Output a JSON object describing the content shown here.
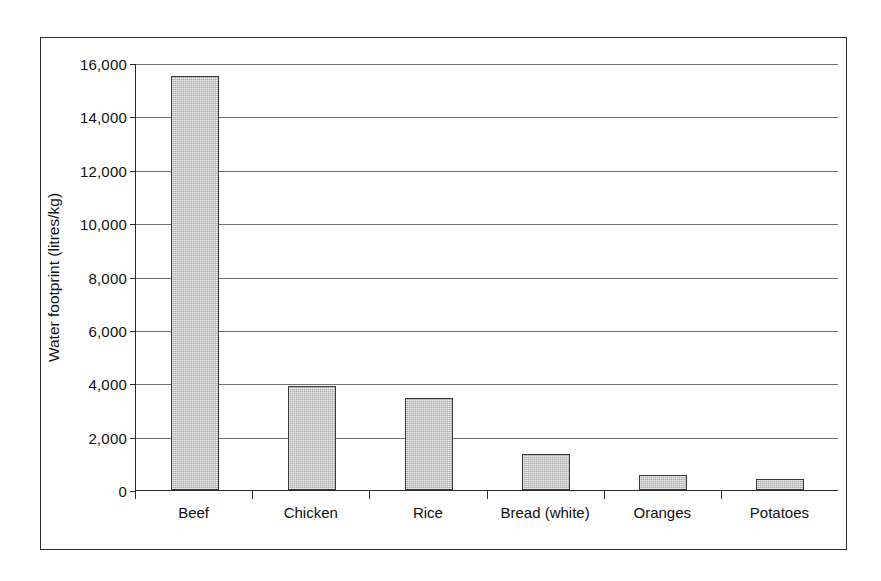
{
  "chart_data": {
    "type": "bar",
    "title": "",
    "xlabel": "",
    "ylabel": "Water footprint (litres/kg)",
    "categories": [
      "Beef",
      "Chicken",
      "Rice",
      "Bread (white)",
      "Oranges",
      "Potatoes"
    ],
    "values": [
      15500,
      3900,
      3450,
      1350,
      560,
      400
    ],
    "ylim": [
      0,
      16000
    ],
    "ytick_step": 2000,
    "ytick_labels": [
      "16,000",
      "14,000",
      "12,000",
      "10,000",
      "8,000",
      "6,000",
      "4,000",
      "2,000",
      "0"
    ],
    "ytick_values": [
      16000,
      14000,
      12000,
      10000,
      8000,
      6000,
      4000,
      2000,
      0
    ],
    "grid": "horizontal",
    "legend": "none",
    "bar_fill_color": "#a9a9a9",
    "bar_border_color": "#3a3a3a",
    "axis_color": "#2b2b2b",
    "gridline_color": "#555555",
    "background_color": "#ffffff"
  }
}
